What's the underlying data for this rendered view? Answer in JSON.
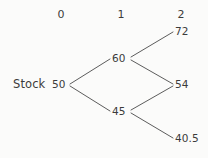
{
  "figure": {
    "type": "binomial-tree",
    "background_color": "#fbfbfa",
    "text_color": "#3b3b3b",
    "line_color": "#4a4a4a",
    "row_label": "Stock",
    "period_headers": [
      {
        "label": "0",
        "x": 61,
        "y": 9
      },
      {
        "label": "1",
        "x": 121,
        "y": 9
      },
      {
        "label": "2",
        "x": 181,
        "y": 9
      }
    ],
    "nodes": [
      {
        "id": "n0",
        "label": "50",
        "period": 0,
        "x": 52,
        "y": 79
      },
      {
        "id": "n1u",
        "label": "60",
        "period": 1,
        "x": 112,
        "y": 53
      },
      {
        "id": "n1d",
        "label": "45",
        "period": 1,
        "x": 112,
        "y": 106
      },
      {
        "id": "n2uu",
        "label": "72",
        "period": 2,
        "x": 175,
        "y": 26
      },
      {
        "id": "n2ud",
        "label": "54",
        "period": 2,
        "x": 175,
        "y": 79
      },
      {
        "id": "n2dd",
        "label": "40.5",
        "period": 2,
        "x": 175,
        "y": 133
      }
    ],
    "edges": [
      {
        "from": "50",
        "to": "60",
        "x1": 70,
        "y1": 84,
        "x2": 110,
        "y2": 59
      },
      {
        "from": "50",
        "to": "45",
        "x1": 70,
        "y1": 86,
        "x2": 110,
        "y2": 111
      },
      {
        "from": "60",
        "to": "72",
        "x1": 131,
        "y1": 57,
        "x2": 173,
        "y2": 32
      },
      {
        "from": "60",
        "to": "54",
        "x1": 131,
        "y1": 60,
        "x2": 173,
        "y2": 84
      },
      {
        "from": "45",
        "to": "54",
        "x1": 131,
        "y1": 110,
        "x2": 173,
        "y2": 86
      },
      {
        "from": "45",
        "to": "40.5",
        "x1": 131,
        "y1": 113,
        "x2": 173,
        "y2": 138
      }
    ]
  },
  "chart_data": {
    "type": "diagram",
    "title": "",
    "subtitle": "",
    "diagram_kind": "recombining binomial lattice",
    "row_name": "Stock",
    "periods": [
      0,
      1,
      2
    ],
    "period_labels": [
      "0",
      "1",
      "2"
    ],
    "up_factor": 1.2,
    "down_factor": 0.9,
    "nodes_by_period": [
      [
        "50"
      ],
      [
        "60",
        "45"
      ],
      [
        "72",
        "54",
        "40.5"
      ]
    ],
    "values_by_period": [
      [
        50
      ],
      [
        60,
        45
      ],
      [
        72,
        54,
        40.5
      ]
    ],
    "transitions": [
      [
        "50",
        "60"
      ],
      [
        "50",
        "45"
      ],
      [
        "60",
        "72"
      ],
      [
        "60",
        "54"
      ],
      [
        "45",
        "54"
      ],
      [
        "45",
        "40.5"
      ]
    ],
    "xlabel": "",
    "ylabel": "",
    "legend": []
  }
}
